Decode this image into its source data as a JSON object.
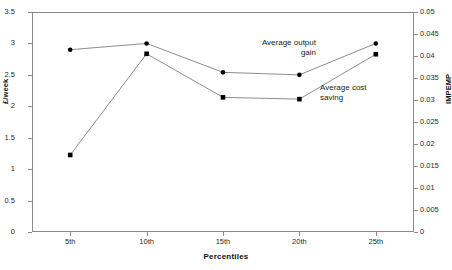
{
  "chart_data": {
    "type": "line",
    "title": "",
    "xlabel": "Percentiles",
    "ylabel": "£/week",
    "y2label": "IMPEMP",
    "categories": [
      "5th",
      "10th",
      "15th",
      "20th",
      "25th"
    ],
    "ylim": [
      0,
      3.5
    ],
    "y2lim": [
      0,
      0.05
    ],
    "grid": false,
    "legend_position": "inline-annotations",
    "yticks": [
      "0",
      "0.5",
      "1",
      "1.5",
      "2",
      "2.5",
      "3",
      "3.5"
    ],
    "ytick_values": [
      0,
      0.5,
      1,
      1.5,
      2,
      2.5,
      3,
      3.5
    ],
    "y2ticks": [
      "0",
      "0.005",
      "0.01",
      "0.015",
      "0.02",
      "0.025",
      "0.03",
      "0.035",
      "0.04",
      "0.045",
      "0.05"
    ],
    "y2tick_values": [
      0,
      0.005,
      0.01,
      0.015,
      0.02,
      0.025,
      0.03,
      0.035,
      0.04,
      0.045,
      0.05
    ],
    "series": [
      {
        "name": "Average output gain",
        "axis": "left",
        "marker": "circle",
        "values": [
          2.9,
          3.0,
          2.54,
          2.5,
          3.0
        ]
      },
      {
        "name": "Average cost saving",
        "axis": "right",
        "marker": "square",
        "values": [
          0.0175,
          0.0405,
          0.0306,
          0.0302,
          0.0404
        ]
      }
    ],
    "annotations": [
      {
        "text": "Average output\ngain",
        "series": "Average output gain"
      },
      {
        "text": "Average cost\nsaving",
        "series": "Average cost saving"
      }
    ]
  },
  "axes": {
    "x_title": "Percentiles",
    "y_left_title": "£/week",
    "y_right_title": "IMPEMP"
  },
  "annotations": {
    "output_gain": "Average output\ngain",
    "cost_saving": "Average cost\nsaving"
  },
  "artifacts": {
    "top_cropped_text": ""
  },
  "colors": {
    "line": "#6e6e6e",
    "marker": "#000000",
    "axis": "#8a8a8a",
    "text": "#1a1a1a",
    "background": "#ffffff"
  }
}
